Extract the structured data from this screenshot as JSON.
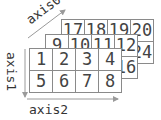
{
  "diagram": {
    "axes": {
      "axis0": "axis0",
      "axis1": "axis1",
      "axis2": "axis2"
    },
    "layers": [
      {
        "name": "back",
        "cells": [
          "17",
          "18",
          "19",
          "20",
          "21",
          "22",
          "23",
          "24"
        ]
      },
      {
        "name": "middle",
        "cells": [
          "9",
          "10",
          "11",
          "12",
          "13",
          "14",
          "15",
          "16"
        ]
      },
      {
        "name": "front",
        "cells": [
          "1",
          "2",
          "3",
          "4",
          "5",
          "6",
          "7",
          "8"
        ]
      }
    ],
    "colors": {
      "grid_line": "#8a8a8a",
      "text": "#444444",
      "arrow": "#9a9a9a"
    }
  }
}
